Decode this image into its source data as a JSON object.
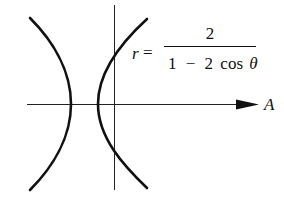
{
  "figure": {
    "type": "polar-conic-graph",
    "curve": "hyperbola",
    "equation": {
      "lhs": "r",
      "equals": "=",
      "numerator": "2",
      "denominator_parts": [
        "1",
        "−",
        "2",
        "cos",
        "θ"
      ]
    },
    "axis_label": "A",
    "colors": {
      "stroke": "#111111",
      "background": "#ffffff"
    }
  }
}
